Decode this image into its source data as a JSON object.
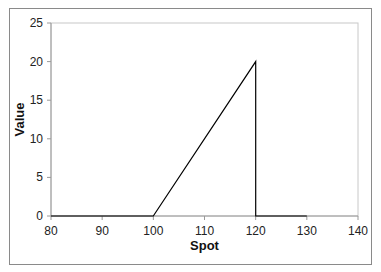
{
  "chart_data": {
    "type": "line",
    "title": "",
    "xlabel": "Spot",
    "ylabel": "Value",
    "xlim": [
      80,
      140
    ],
    "ylim": [
      0,
      25
    ],
    "x_ticks": [
      80,
      90,
      100,
      110,
      120,
      130,
      140
    ],
    "y_ticks": [
      0,
      5,
      10,
      15,
      20,
      25
    ],
    "grid": false,
    "legend": null,
    "series": [
      {
        "name": "Payoff",
        "color": "#000000",
        "points": [
          [
            80,
            0
          ],
          [
            100,
            0
          ],
          [
            120,
            20
          ],
          [
            120,
            0
          ],
          [
            130,
            0
          ]
        ]
      }
    ]
  }
}
